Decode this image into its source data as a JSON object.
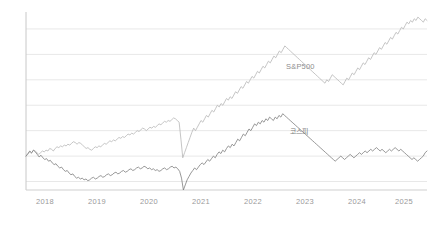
{
  "chart_data": {
    "type": "line",
    "title": "",
    "subtitle": "",
    "xlabel": "",
    "ylabel": "",
    "grid": true,
    "legend_position": "inline-right",
    "x_ticks": [
      "2018",
      "2019",
      "2020",
      "2021",
      "2022",
      "2023",
      "2024",
      "2025"
    ],
    "x_tick_positions": [
      45,
      97,
      149,
      201,
      253,
      305,
      357,
      404
    ],
    "xlim": [
      2017.75,
      2025.15
    ],
    "ylim": [
      -40,
      170
    ],
    "y_gridline_values": [
      150,
      120,
      90,
      60,
      30,
      0,
      -30
    ],
    "y_axis_labels_visible": false,
    "series": [
      {
        "name": "S&P500",
        "color": "#b6b6b6",
        "label_x": 286,
        "label_y": 62,
        "values": [
          0,
          2,
          5,
          3,
          7,
          6,
          4,
          2,
          4,
          6,
          5,
          7,
          6,
          9,
          8,
          6,
          9,
          11,
          10,
          12,
          11,
          13,
          12,
          14,
          13,
          15,
          17,
          16,
          14,
          16,
          15,
          13,
          11,
          9,
          10,
          8,
          7,
          9,
          11,
          10,
          12,
          11,
          13,
          15,
          14,
          16,
          18,
          17,
          19,
          18,
          20,
          22,
          21,
          23,
          22,
          24,
          26,
          25,
          27,
          26,
          28,
          30,
          29,
          31,
          33,
          32,
          30,
          32,
          34,
          33,
          35,
          34,
          36,
          38,
          37,
          39,
          41,
          40,
          42,
          41,
          43,
          45,
          44,
          42,
          40,
          20,
          -2,
          4,
          10,
          16,
          22,
          28,
          33,
          30,
          34,
          38,
          42,
          40,
          44,
          48,
          46,
          50,
          54,
          52,
          56,
          60,
          58,
          62,
          60,
          64,
          68,
          66,
          70,
          68,
          72,
          76,
          74,
          78,
          82,
          80,
          84,
          88,
          86,
          90,
          94,
          92,
          96,
          100,
          98,
          102,
          106,
          104,
          108,
          112,
          110,
          114,
          118,
          116,
          120,
          124,
          122,
          126,
          130,
          128,
          126,
          124,
          122,
          120,
          118,
          116,
          114,
          112,
          110,
          108,
          106,
          104,
          102,
          100,
          98,
          96,
          94,
          92,
          90,
          88,
          86,
          90,
          88,
          92,
          96,
          94,
          92,
          90,
          88,
          86,
          84,
          88,
          92,
          90,
          94,
          98,
          96,
          100,
          104,
          102,
          106,
          110,
          108,
          112,
          116,
          114,
          118,
          122,
          120,
          124,
          128,
          126,
          130,
          134,
          132,
          136,
          140,
          138,
          142,
          146,
          144,
          148,
          152,
          150,
          154,
          158,
          156,
          160,
          158,
          162,
          160,
          164,
          162,
          160,
          158,
          162,
          160
        ]
      },
      {
        "name": "코스피",
        "color": "#7d7d7d",
        "label_x": 290,
        "label_y": 127,
        "values": [
          0,
          3,
          6,
          4,
          7,
          5,
          2,
          -1,
          1,
          -2,
          -4,
          -3,
          -6,
          -5,
          -8,
          -10,
          -9,
          -12,
          -14,
          -13,
          -16,
          -18,
          -17,
          -20,
          -22,
          -21,
          -24,
          -26,
          -25,
          -27,
          -26,
          -28,
          -27,
          -29,
          -28,
          -26,
          -25,
          -27,
          -26,
          -24,
          -23,
          -25,
          -24,
          -22,
          -21,
          -23,
          -22,
          -20,
          -19,
          -21,
          -20,
          -18,
          -17,
          -19,
          -18,
          -16,
          -15,
          -17,
          -16,
          -14,
          -13,
          -15,
          -14,
          -12,
          -13,
          -15,
          -14,
          -16,
          -15,
          -17,
          -16,
          -18,
          -17,
          -15,
          -14,
          -16,
          -15,
          -13,
          -12,
          -14,
          -13,
          -15,
          -18,
          -26,
          -40,
          -34,
          -28,
          -24,
          -20,
          -17,
          -14,
          -16,
          -13,
          -10,
          -8,
          -10,
          -7,
          -4,
          -6,
          -3,
          0,
          -2,
          2,
          5,
          3,
          7,
          5,
          9,
          12,
          10,
          14,
          12,
          16,
          20,
          18,
          22,
          26,
          24,
          28,
          32,
          30,
          34,
          38,
          36,
          40,
          38,
          42,
          40,
          44,
          42,
          46,
          44,
          42,
          46,
          44,
          48,
          46,
          50,
          48,
          46,
          44,
          42,
          40,
          38,
          36,
          34,
          32,
          30,
          28,
          26,
          24,
          22,
          20,
          18,
          16,
          14,
          12,
          10,
          8,
          6,
          4,
          2,
          0,
          -2,
          -4,
          -6,
          -4,
          -2,
          0,
          -2,
          -4,
          -2,
          0,
          2,
          0,
          -2,
          0,
          2,
          4,
          2,
          4,
          6,
          4,
          6,
          8,
          6,
          8,
          10,
          8,
          6,
          8,
          6,
          4,
          6,
          8,
          6,
          8,
          10,
          8,
          6,
          8,
          6,
          4,
          2,
          0,
          -2,
          -4,
          -2,
          -4,
          -6,
          -4,
          -2,
          0,
          4,
          6
        ]
      }
    ]
  },
  "axes": {
    "y_axis_color": "#c8c8c8",
    "x_axis_color": "#cfcfcf",
    "gridline_color": "#e8e8e8",
    "tick_label_color": "#9a9a9a"
  }
}
